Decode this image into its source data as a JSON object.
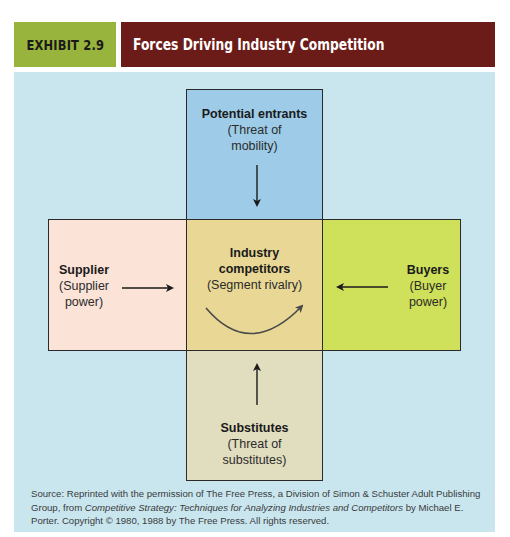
{
  "header": {
    "exhibit_label": "EXHIBIT 2.9",
    "title": "Forces Driving Industry Competition",
    "colors": {
      "label_bg": "#98b43c",
      "title_bg": "#6b1c18",
      "panel_bg": "#c9e6ef"
    }
  },
  "diagram": {
    "top": {
      "title": "Potential entrants",
      "subtitle": "(Threat of mobility)",
      "line1": "(Threat of",
      "line2": "mobility)",
      "color": "#9dcbe8"
    },
    "left": {
      "title": "Supplier",
      "line1": "(Supplier",
      "line2": "power)",
      "color": "#fbe3d8"
    },
    "center": {
      "title_line1": "Industry",
      "title_line2": "competitors",
      "subtitle": "(Segment rivalry)",
      "color": "#e8d795"
    },
    "right": {
      "title": "Buyers",
      "line1": "(Buyer",
      "line2": "power)",
      "color": "#cfe05a"
    },
    "bottom": {
      "title": "Substitutes",
      "line1": "(Threat of",
      "line2": "substitutes)",
      "color": "#e1ddbf"
    },
    "arrows": [
      {
        "from": "top",
        "to": "center",
        "direction": "down"
      },
      {
        "from": "left",
        "to": "center",
        "direction": "right"
      },
      {
        "from": "right",
        "to": "center",
        "direction": "left"
      },
      {
        "from": "bottom",
        "to": "center",
        "direction": "up"
      },
      {
        "from": "center",
        "to": "center",
        "direction": "curved-rivalry"
      }
    ]
  },
  "source": {
    "prefix": "Source: Reprinted with the permission of The Free Press, a Division of Simon & Schuster Adult Publishing Group, from ",
    "book": "Competitive Strategy: Techniques for Analyzing Industries and Competitors",
    "suffix": " by Michael E. Porter. Copyright © 1980, 1988 by The Free Press. All rights reserved."
  }
}
